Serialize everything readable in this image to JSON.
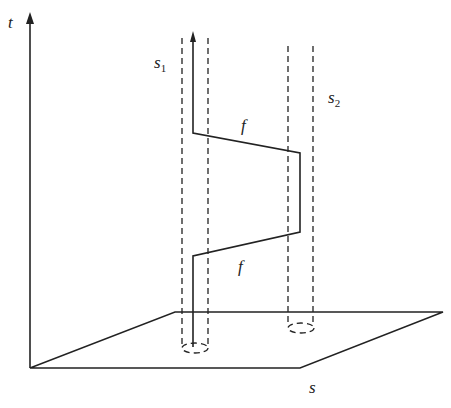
{
  "diagram": {
    "colors": {
      "stroke": "#222222",
      "background": "#ffffff"
    },
    "labels": {
      "t_axis": "t",
      "s_axis": "s",
      "s1_main": "s",
      "s1_sub": "1",
      "s2_main": "s",
      "s2_sub": "2",
      "f_upper": "f",
      "f_lower": "f"
    }
  }
}
